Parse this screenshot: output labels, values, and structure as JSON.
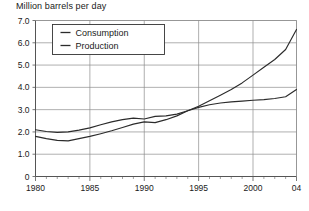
{
  "chart_data": {
    "type": "line",
    "title": "Million barrels per day",
    "xlabel": "",
    "ylabel": "",
    "xlim": [
      1980,
      2004
    ],
    "ylim": [
      0,
      7
    ],
    "grid": true,
    "legend_position": "top-left",
    "x": [
      1980,
      1981,
      1982,
      1983,
      1984,
      1985,
      1986,
      1987,
      1988,
      1989,
      1990,
      1991,
      1992,
      1993,
      1994,
      1995,
      1996,
      1997,
      1998,
      1999,
      2000,
      2001,
      2002,
      2003,
      2004
    ],
    "xticks": [
      1980,
      1985,
      1990,
      1995,
      2000,
      2004
    ],
    "xtick_labels": [
      "1980",
      "1985",
      "1990",
      "1995",
      "2000",
      "04"
    ],
    "yticks": [
      0,
      1,
      2,
      3,
      4,
      5,
      6,
      7
    ],
    "ytick_labels": [
      "0",
      "1.0",
      "2.0",
      "3.0",
      "4.0",
      "5.0",
      "6.0",
      "7.0"
    ],
    "series": [
      {
        "name": "Consumption",
        "values": [
          1.8,
          1.7,
          1.62,
          1.6,
          1.7,
          1.8,
          1.92,
          2.05,
          2.2,
          2.35,
          2.45,
          2.42,
          2.55,
          2.72,
          2.95,
          3.15,
          3.4,
          3.65,
          3.9,
          4.2,
          4.55,
          4.9,
          5.25,
          5.7,
          6.6
        ]
      },
      {
        "name": "Production",
        "values": [
          2.1,
          2.02,
          1.98,
          2.0,
          2.08,
          2.18,
          2.32,
          2.45,
          2.55,
          2.62,
          2.58,
          2.7,
          2.72,
          2.8,
          2.95,
          3.1,
          3.22,
          3.3,
          3.35,
          3.38,
          3.42,
          3.45,
          3.5,
          3.58,
          3.9
        ]
      }
    ],
    "legend": [
      {
        "label": "Consumption"
      },
      {
        "label": "Production"
      }
    ],
    "colors": {
      "line": "#2b2b2b",
      "grid": "#8c8c8c",
      "axis": "#555555",
      "text": "#1a1a1a",
      "background": "#ffffff"
    }
  }
}
